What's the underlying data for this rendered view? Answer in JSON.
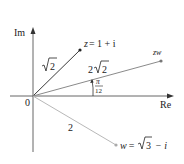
{
  "figure": {
    "type": "argand-diagram",
    "axes": {
      "x_label": "Re",
      "y_label": "Im",
      "origin_label": "0"
    },
    "points": [
      {
        "name": "z",
        "label_lhs": "z",
        "label_rhs": "= 1 + i",
        "modulus_label_prefix": "",
        "modulus_label_radicand": "2",
        "color": "#3a3a3a"
      },
      {
        "name": "zw",
        "label": "zw",
        "modulus_label_prefix": "2",
        "modulus_label_radicand": "2",
        "color": "#8a8a8a"
      },
      {
        "name": "w",
        "label_lhs": "w",
        "label_eq": "=",
        "label_radicand": "3",
        "label_tail": "− i",
        "modulus_label": "2",
        "color": "#b4b4b4"
      }
    ],
    "angle": {
      "numerator": "π",
      "denominator": "12"
    },
    "colors": {
      "axis": "#555555",
      "z_vector": "#3a3a3a",
      "zw_vector": "#8a8a8a",
      "w_vector": "#b8b8b8",
      "text": "#222222"
    }
  }
}
